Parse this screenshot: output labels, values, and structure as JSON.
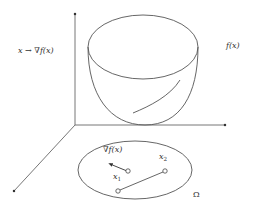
{
  "diagram": {
    "title": "",
    "labels": {
      "gradient_map": "x → ∇f(x)",
      "function": "f(x)",
      "gradient": "∇f(x)",
      "point1_base": "x",
      "point1_sub": "1",
      "point2_base": "x",
      "point2_sub": "2",
      "domain": "Ω"
    },
    "elements": {
      "axes": [
        "vertical-axis",
        "horizontal-axis",
        "depth-axis"
      ],
      "surface": "convex bowl-shaped graph of f(x)",
      "domain_region": "ellipse Ω in the base plane",
      "points": [
        "x1",
        "x2"
      ],
      "segment": "line segment between two points in Ω",
      "gradient_arrow": "arrow from x1 showing ∇f(x)"
    },
    "colors": {
      "stroke": "#555555",
      "text": "#333333",
      "background": "#ffffff"
    }
  }
}
